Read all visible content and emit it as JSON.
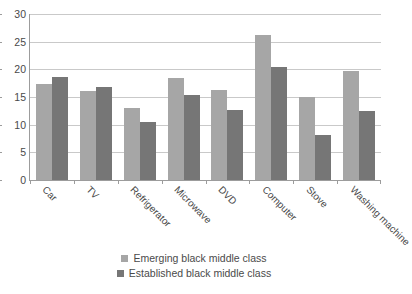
{
  "chart_data": {
    "type": "bar",
    "title": "",
    "subtitle": "",
    "xlabel": "",
    "ylabel": "",
    "ylim": [
      0,
      30
    ],
    "y_ticks": [
      0,
      5,
      10,
      15,
      20,
      25,
      30
    ],
    "grid": true,
    "legend_position": "bottom",
    "categories": [
      "Car",
      "TV",
      "Refrigerator",
      "Microwave",
      "DVD",
      "Computer",
      "Stove",
      "Washing machine"
    ],
    "series": [
      {
        "name": "Emerging black middle class",
        "color": "#a6a6a6",
        "values": [
          17.4,
          16.1,
          13.0,
          18.5,
          16.2,
          26.2,
          15.0,
          19.7
        ]
      },
      {
        "name": "Established black middle class",
        "color": "#767676",
        "values": [
          18.6,
          16.8,
          10.5,
          15.4,
          12.7,
          20.4,
          8.1,
          12.5
        ]
      }
    ]
  },
  "axis": {
    "y_tick_labels": [
      "30",
      "25",
      "20",
      "15",
      "10",
      "5",
      "0"
    ]
  },
  "legend": {
    "items": [
      {
        "label": "Emerging black middle class"
      },
      {
        "label": "Established black middle class"
      }
    ]
  }
}
